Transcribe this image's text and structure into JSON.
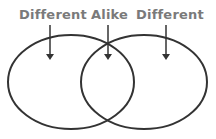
{
  "diagram": {
    "type": "venn",
    "labels": [
      {
        "id": "left",
        "text": "Different"
      },
      {
        "id": "center",
        "text": "Alike"
      },
      {
        "id": "right",
        "text": "Different"
      }
    ],
    "sets": [
      "left-circle",
      "right-circle"
    ],
    "colors": {
      "label": "#7a7a7a",
      "stroke": "#333333",
      "background": "#ffffff"
    }
  }
}
